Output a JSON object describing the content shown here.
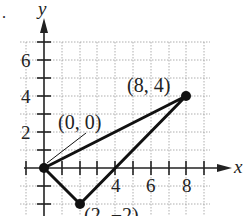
{
  "figure": {
    "bullet": ".",
    "axes": {
      "x_label": "x",
      "y_label": "y",
      "x_ticks": [
        {
          "value": 4,
          "label": "4"
        },
        {
          "value": 6,
          "label": "6"
        },
        {
          "value": 8,
          "label": "8"
        }
      ],
      "y_ticks": [
        {
          "value": 2,
          "label": "2"
        },
        {
          "value": 4,
          "label": "4"
        },
        {
          "value": 6,
          "label": "6"
        }
      ]
    },
    "points": [
      {
        "x": 0,
        "y": 0,
        "label": "(0, 0)"
      },
      {
        "x": 8,
        "y": 4,
        "label": "(8, 4)"
      },
      {
        "x": 2,
        "y": -2,
        "label": "(2, −2)"
      }
    ],
    "colors": {
      "axis": "#222222",
      "grid": "#9a9a9a",
      "triangle": "#111111"
    }
  }
}
